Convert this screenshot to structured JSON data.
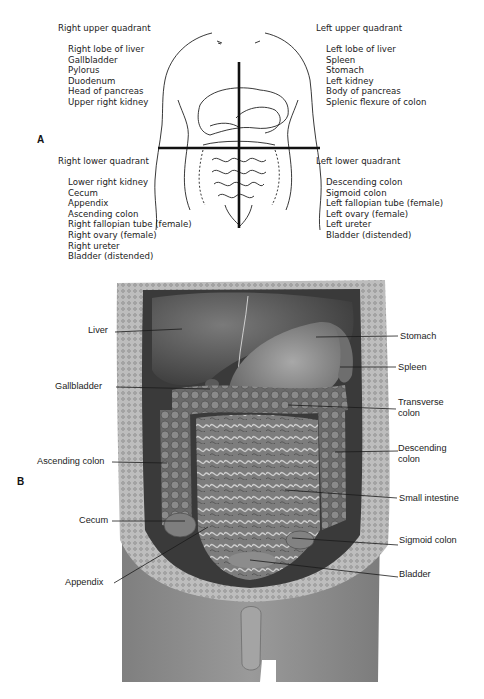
{
  "figure": {
    "panel_a": {
      "letter": "A",
      "quadrants": {
        "right_upper": {
          "title": "Right upper quadrant",
          "items": [
            "Right lobe of liver",
            "Gallbladder",
            "Pylorus",
            "Duodenum",
            "Head of pancreas",
            "Upper right kidney"
          ]
        },
        "left_upper": {
          "title": "Left upper quadrant",
          "items": [
            "Left lobe of liver",
            "Spleen",
            "Stomach",
            "Left kidney",
            "Body of pancreas",
            "Splenic flexure of colon"
          ]
        },
        "right_lower": {
          "title": "Right lower quadrant",
          "items": [
            "Lower right kidney",
            "Cecum",
            "Appendix",
            "Ascending colon",
            "Right fallopian tube (female)",
            "Right ovary (female)",
            "Right ureter",
            "Bladder (distended)"
          ]
        },
        "left_lower": {
          "title": "Left lower quadrant",
          "items": [
            "Descending colon",
            "Sigmoid colon",
            "Left fallopian tube (female)",
            "Left ovary (female)",
            "Left ureter",
            "Bladder (distended)"
          ]
        }
      }
    },
    "panel_b": {
      "letter": "B",
      "labels_left": [
        "Liver",
        "Gallbladder",
        "Ascending colon",
        "Cecum",
        "Appendix"
      ],
      "labels_right": [
        "Stomach",
        "Spleen",
        "Transverse colon",
        "Descending colon",
        "Small intestine",
        "Sigmoid colon",
        "Bladder"
      ],
      "transverse_line1": "Transverse",
      "transverse_line2": "colon",
      "descending_line1": "Descending",
      "descending_line2": "colon"
    },
    "colors": {
      "ink": "#1a1a1a",
      "cavity_dark": "#3a3a3a",
      "organ_mid": "#6f6f6f",
      "skin": "#8a8a8a",
      "wall": "#b5b5b5"
    }
  }
}
